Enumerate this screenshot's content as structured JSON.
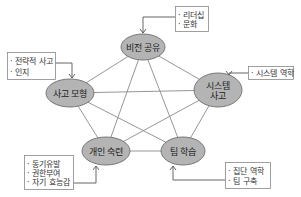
{
  "colors": {
    "node_fill": "#b4b4b4",
    "node_stroke": "#6e6e6e",
    "edge": "#8a8a8a",
    "box_stroke": "#888888",
    "arrow": "#555555"
  },
  "nodes": [
    {
      "id": "vision",
      "lines": [
        "비전 공유"
      ],
      "cx": 143,
      "cy": 47,
      "rx": 22,
      "ry": 13
    },
    {
      "id": "mental",
      "lines": [
        "사고 모형"
      ],
      "cx": 70,
      "cy": 93,
      "rx": 24,
      "ry": 14
    },
    {
      "id": "systems",
      "lines": [
        "시스템",
        "사고"
      ],
      "cx": 218,
      "cy": 90,
      "rx": 24,
      "ry": 17
    },
    {
      "id": "mastery",
      "lines": [
        "개인 숙련"
      ],
      "cx": 106,
      "cy": 151,
      "rx": 24,
      "ry": 14
    },
    {
      "id": "team",
      "lines": [
        "팀 학습"
      ],
      "cx": 183,
      "cy": 151,
      "rx": 22,
      "ry": 14
    }
  ],
  "edges": [
    [
      "vision",
      "mental"
    ],
    [
      "vision",
      "systems"
    ],
    [
      "vision",
      "mastery"
    ],
    [
      "vision",
      "team"
    ],
    [
      "mental",
      "systems"
    ],
    [
      "mental",
      "mastery"
    ],
    [
      "mental",
      "team"
    ],
    [
      "systems",
      "mastery"
    ],
    [
      "systems",
      "team"
    ],
    [
      "mastery",
      "team"
    ]
  ],
  "annotations": [
    {
      "id": "vision-notes",
      "items": [
        "리더십",
        "문화"
      ],
      "x": 175,
      "y": 6,
      "w": 33,
      "h": 25,
      "target": "vision"
    },
    {
      "id": "mental-notes",
      "items": [
        "전략적 사고",
        "인지"
      ],
      "x": 7,
      "y": 52,
      "w": 48,
      "h": 27,
      "target": "mental"
    },
    {
      "id": "systems-notes",
      "items": [
        "시스템 역학"
      ],
      "x": 248,
      "y": 66,
      "w": 45,
      "h": 13,
      "target": "systems"
    },
    {
      "id": "mastery-notes",
      "items": [
        "동기유발",
        "권한부여",
        "자기 효능감"
      ],
      "x": 24,
      "y": 155,
      "w": 49,
      "h": 34,
      "target": "mastery"
    },
    {
      "id": "team-notes",
      "items": [
        "집단 역학",
        "팀 구축"
      ],
      "x": 225,
      "y": 162,
      "w": 45,
      "h": 26,
      "target": "team"
    }
  ]
}
